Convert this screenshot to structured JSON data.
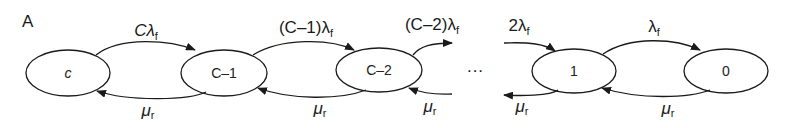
{
  "panel_label": "A",
  "nodes": [
    {
      "id": "c",
      "label": "c"
    },
    {
      "id": "c-1",
      "label": "C–1"
    },
    {
      "id": "c-2",
      "label": "C–2"
    },
    {
      "id": "1",
      "label": "1"
    },
    {
      "id": "0",
      "label": "0"
    }
  ],
  "ellipsis": "···",
  "transitions": {
    "forward": [
      {
        "from": "c",
        "to": "c-1",
        "rate": "Cλ",
        "sub": "f"
      },
      {
        "from": "c-1",
        "to": "c-2",
        "rate": "(C–1)λ",
        "sub": "f"
      },
      {
        "from": "c-2",
        "to": "...",
        "rate": "(C–2)λ",
        "sub": "f"
      },
      {
        "from": "...",
        "to": "1",
        "rate": "2λ",
        "sub": "f"
      },
      {
        "from": "1",
        "to": "0",
        "rate": "λ",
        "sub": "f"
      }
    ],
    "backward": [
      {
        "from": "c-1",
        "to": "c",
        "rate": "μ",
        "sub": "r"
      },
      {
        "from": "c-2",
        "to": "c-1",
        "rate": "μ",
        "sub": "r"
      },
      {
        "from": "...",
        "to": "c-2",
        "rate": "μ",
        "sub": "r"
      },
      {
        "from": "1",
        "to": "...",
        "rate": "μ",
        "sub": "r"
      },
      {
        "from": "0",
        "to": "1",
        "rate": "μ",
        "sub": "r"
      }
    ]
  }
}
